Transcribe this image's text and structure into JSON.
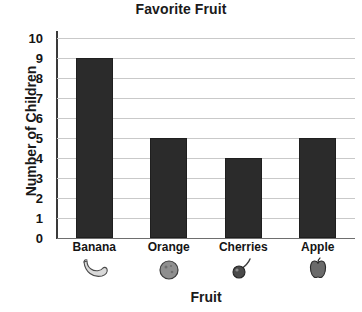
{
  "chart_data": {
    "type": "bar",
    "title": "Favorite Fruit",
    "xlabel": "Fruit",
    "ylabel": "Number of Children",
    "categories": [
      "Banana",
      "Orange",
      "Cherries",
      "Apple"
    ],
    "values": [
      9,
      5,
      4,
      5
    ],
    "ylim": [
      0,
      10
    ],
    "ytick_labels": [
      "10",
      "9",
      "8",
      "7",
      "6",
      "5",
      "4",
      "3",
      "2",
      "1",
      "0"
    ],
    "ytick_values": [
      10,
      9,
      8,
      7,
      6,
      5,
      4,
      3,
      2,
      1,
      0
    ],
    "grid": true,
    "legend": false,
    "bar_color": "#2b2b2b",
    "grid_color": "#c9c9c9",
    "axis_color": "#3a3a3a",
    "background": "#ffffff",
    "category_icons": [
      "banana-icon",
      "orange-icon",
      "cherries-icon",
      "apple-icon"
    ]
  }
}
